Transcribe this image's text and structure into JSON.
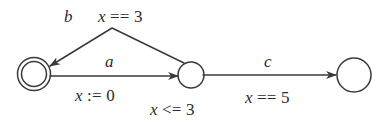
{
  "diagram": {
    "kind": "timed-automaton",
    "stroke_color": "#3a3a3a",
    "background_color": "#ffffff",
    "states": [
      {
        "id": "s0",
        "shape": "double-circle",
        "role": "accepting",
        "invariant": ""
      },
      {
        "id": "s1",
        "shape": "circle",
        "role": "normal",
        "invariant": "x <= 3"
      },
      {
        "id": "s2",
        "shape": "circle",
        "role": "normal",
        "invariant": ""
      }
    ],
    "transitions": [
      {
        "id": "t-a",
        "from": "s0",
        "to": "s1",
        "event": "a",
        "guard": "",
        "action": "x := 0",
        "path": "straight"
      },
      {
        "id": "t-b",
        "from": "s1",
        "to": "s0",
        "event": "b",
        "guard": "x == 3",
        "action": "",
        "path": "peaked"
      },
      {
        "id": "t-c",
        "from": "s1",
        "to": "s2",
        "event": "c",
        "guard": "x == 5",
        "action": "",
        "path": "straight"
      }
    ],
    "labels": {
      "event_b": "b",
      "guard_b": {
        "var": "x",
        "op": "==",
        "value": "3"
      },
      "event_a": "a",
      "action_a": {
        "var": "x",
        "op": ":=",
        "value": "0"
      },
      "invariant_s1": {
        "var": "x",
        "op": "<=",
        "value": "3"
      },
      "event_c": "c",
      "guard_c": {
        "var": "x",
        "op": "==",
        "value": "5"
      }
    }
  }
}
